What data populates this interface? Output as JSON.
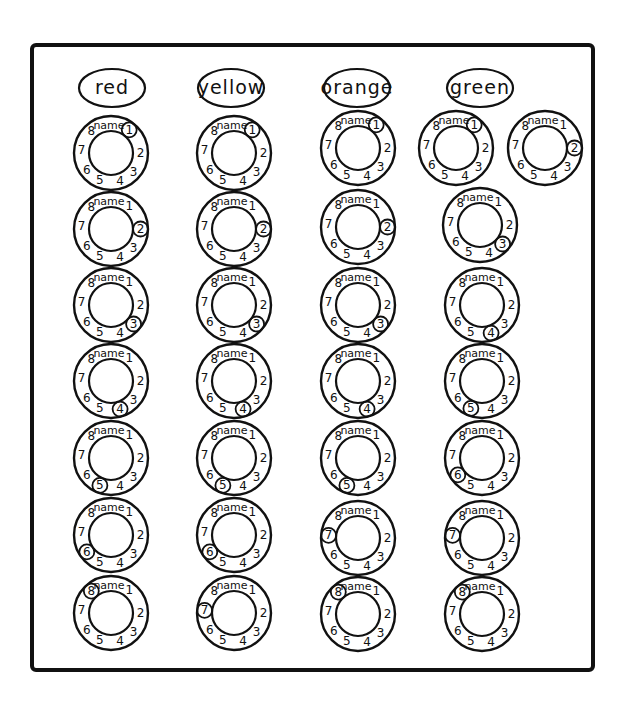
{
  "diagram": {
    "ring_label": "name",
    "ring_numbers": [
      "1",
      "2",
      "3",
      "4",
      "5",
      "6",
      "7",
      "8"
    ],
    "columns": [
      {
        "label": "red",
        "center_x": 112,
        "rings": [
          {
            "x": 111,
            "y": 153,
            "circled": "1"
          },
          {
            "x": 111,
            "y": 229,
            "circled": "2"
          },
          {
            "x": 111,
            "y": 305,
            "circled": "3"
          },
          {
            "x": 111,
            "y": 381,
            "circled": "4"
          },
          {
            "x": 111,
            "y": 458,
            "circled": "5"
          },
          {
            "x": 111,
            "y": 535,
            "circled": "6"
          },
          {
            "x": 111,
            "y": 613,
            "circled": "8"
          }
        ]
      },
      {
        "label": "yellow",
        "center_x": 231,
        "rings": [
          {
            "x": 234,
            "y": 153,
            "circled": "1"
          },
          {
            "x": 234,
            "y": 229,
            "circled": "2"
          },
          {
            "x": 234,
            "y": 305,
            "circled": "3"
          },
          {
            "x": 234,
            "y": 381,
            "circled": "4"
          },
          {
            "x": 234,
            "y": 458,
            "circled": "5"
          },
          {
            "x": 234,
            "y": 535,
            "circled": "6"
          },
          {
            "x": 234,
            "y": 613,
            "circled": "7"
          }
        ]
      },
      {
        "label": "orange",
        "center_x": 357,
        "rings": [
          {
            "x": 358,
            "y": 148,
            "circled": "1"
          },
          {
            "x": 358,
            "y": 227,
            "circled": "2"
          },
          {
            "x": 358,
            "y": 305,
            "circled": "3"
          },
          {
            "x": 358,
            "y": 381,
            "circled": "4"
          },
          {
            "x": 358,
            "y": 458,
            "circled": "5"
          },
          {
            "x": 358,
            "y": 538,
            "circled": "7"
          },
          {
            "x": 358,
            "y": 614,
            "circled": "8"
          }
        ]
      },
      {
        "label": "green",
        "center_x": 480,
        "rings": [
          {
            "x": 456,
            "y": 148,
            "circled": "1"
          },
          {
            "x": 545,
            "y": 148,
            "circled": "2"
          },
          {
            "x": 480,
            "y": 225,
            "circled": "3"
          },
          {
            "x": 482,
            "y": 305,
            "circled": "4"
          },
          {
            "x": 482,
            "y": 381,
            "circled": "5"
          },
          {
            "x": 482,
            "y": 458,
            "circled": "6"
          },
          {
            "x": 482,
            "y": 538,
            "circled": "7"
          },
          {
            "x": 482,
            "y": 614,
            "circled": "8"
          }
        ]
      }
    ]
  }
}
